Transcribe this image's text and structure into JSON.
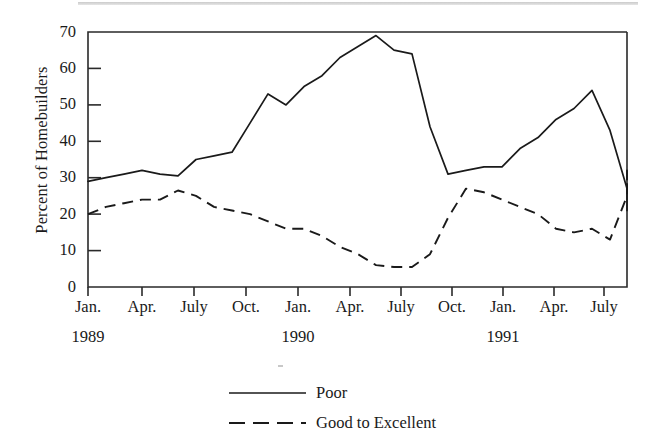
{
  "chart_data": {
    "type": "line",
    "title": "",
    "xlabel": "",
    "ylabel": "Percent of Homebuilders",
    "ylim": [
      0,
      70
    ],
    "yticks": [
      0,
      10,
      20,
      30,
      40,
      50,
      60,
      70
    ],
    "grid": false,
    "legend_position": "bottom-center",
    "x_tick_labels": [
      "Jan.",
      "Apr.",
      "July",
      "Oct.",
      "Jan.",
      "Apr.",
      "July",
      "Oct.",
      "Jan.",
      "Apr.",
      "July"
    ],
    "year_labels": [
      "1989",
      "1990",
      "1991"
    ],
    "x": [
      "1989-01",
      "1989-02",
      "1989-03",
      "1989-04",
      "1989-05",
      "1989-06",
      "1989-07",
      "1989-08",
      "1989-09",
      "1989-10",
      "1989-11",
      "1989-12",
      "1990-01",
      "1990-02",
      "1990-03",
      "1990-04",
      "1990-05",
      "1990-06",
      "1990-07",
      "1990-08",
      "1990-09",
      "1990-10",
      "1990-11",
      "1990-12",
      "1991-01",
      "1991-02",
      "1991-03",
      "1991-04",
      "1991-05",
      "1991-06",
      "1991-07",
      "1991-08",
      "1991-09"
    ],
    "series": [
      {
        "name": "Poor",
        "style": "solid",
        "color": "#1a1a1a",
        "values": [
          29,
          30,
          31,
          32,
          31,
          30.5,
          35,
          36,
          37,
          45,
          53,
          50,
          55,
          58,
          63,
          66,
          69,
          65,
          64,
          44,
          31,
          32,
          33,
          33,
          38,
          41,
          46,
          49,
          54,
          43,
          27,
          23,
          21
        ]
      },
      {
        "name": "Good to Excellent",
        "style": "dashed",
        "color": "#1a1a1a",
        "values": [
          20,
          22,
          23,
          24,
          24,
          26.5,
          25,
          22,
          21,
          20,
          18,
          16,
          16,
          14,
          11,
          9,
          6,
          5.5,
          5.5,
          9,
          19,
          27,
          26,
          24,
          22,
          20,
          16,
          15,
          16,
          13,
          25,
          28,
          32
        ]
      }
    ],
    "series_tail": [
      {
        "name": "Poor",
        "values_end": [
          21,
          25,
          27,
          28,
          28,
          28
        ]
      },
      {
        "name": "Good to Excellent",
        "values_end": [
          32,
          29,
          30,
          31,
          27,
          26,
          26
        ]
      }
    ]
  },
  "legend": {
    "items": [
      {
        "label": "Poor",
        "style": "solid"
      },
      {
        "label": "Good to Excellent",
        "style": "dashed"
      }
    ]
  },
  "axes": {
    "y_title": "Percent of Homebuilders",
    "y_ticks": [
      "70",
      "60",
      "50",
      "40",
      "30",
      "20",
      "10",
      "0"
    ],
    "x_ticks": [
      "Jan.",
      "Apr.",
      "July",
      "Oct.",
      "Jan.",
      "Apr.",
      "July",
      "Oct.",
      "Jan.",
      "Apr.",
      "July"
    ],
    "years": [
      "1989",
      "1990",
      "1991"
    ]
  }
}
